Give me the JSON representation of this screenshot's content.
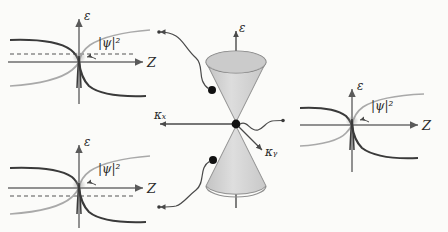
{
  "figure": {
    "type": "physics-schematic",
    "background_color": "#fbfbf9"
  },
  "colors": {
    "dark_band": "#3a3a3a",
    "light_band": "#a9a9a9",
    "axis": "#6e6e6e",
    "cone_fill": "#cfcfcf",
    "cone_rim": "#9a9a9a",
    "dot": "#111111",
    "connector": "#4a4a4a",
    "dashed_level": "#555555"
  },
  "panels": [
    {
      "id": "top-left",
      "name": "band-diagram-top-left",
      "energy_axis_label": "ε",
      "position_axis_label": "Z",
      "wavefunction_label": "|ψ|²",
      "has_dashed_fermi_level": true,
      "has_localized_peak": true
    },
    {
      "id": "bottom-left",
      "name": "band-diagram-bottom-left",
      "energy_axis_label": "ε",
      "position_axis_label": "Z",
      "wavefunction_label": "|ψ|²",
      "has_dashed_fermi_level": true,
      "has_localized_peak": true
    },
    {
      "id": "right",
      "name": "band-diagram-right",
      "energy_axis_label": "ε",
      "position_axis_label": "Z",
      "wavefunction_label": "|ψ|²",
      "has_dashed_fermi_level": false,
      "has_localized_peak": true
    }
  ],
  "dirac_cone": {
    "name": "dirac-cone",
    "energy_axis_label": "ε",
    "kx_axis_label": "κₓ",
    "ky_axis_label": "κᵧ",
    "upper_cone": "conduction-cone",
    "lower_cone": "valence-cone",
    "marked_states": [
      {
        "name": "upper-state-dot"
      },
      {
        "name": "dirac-point-dot"
      },
      {
        "name": "lower-state-dot"
      }
    ]
  },
  "connectors": [
    {
      "name": "connector-upper-left",
      "from": "upper-state-dot",
      "to": "band-diagram-top-left"
    },
    {
      "name": "connector-lower-left",
      "from": "lower-state-dot",
      "to": "band-diagram-bottom-left"
    },
    {
      "name": "connector-right",
      "from": "dirac-point-dot",
      "to": "band-diagram-right"
    }
  ]
}
